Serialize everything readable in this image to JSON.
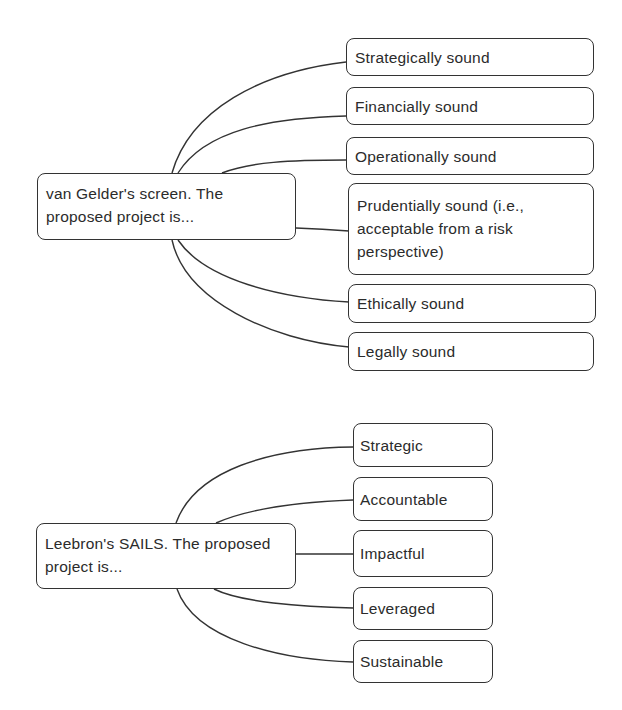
{
  "diagrams": [
    {
      "root": {
        "label": "van Gelder's screen. The proposed project is..."
      },
      "options": [
        {
          "label": "Strategically sound"
        },
        {
          "label": "Financially sound"
        },
        {
          "label": "Operationally sound"
        },
        {
          "label": "Prudentially sound (i.e., acceptable from a risk perspective)"
        },
        {
          "label": "Ethically sound"
        },
        {
          "label": "Legally sound"
        }
      ]
    },
    {
      "root": {
        "label": "Leebron's SAILS. The proposed project is..."
      },
      "options": [
        {
          "label": "Strategic"
        },
        {
          "label": "Accountable"
        },
        {
          "label": "Impactful"
        },
        {
          "label": "Leveraged"
        },
        {
          "label": "Sustainable"
        }
      ]
    }
  ]
}
